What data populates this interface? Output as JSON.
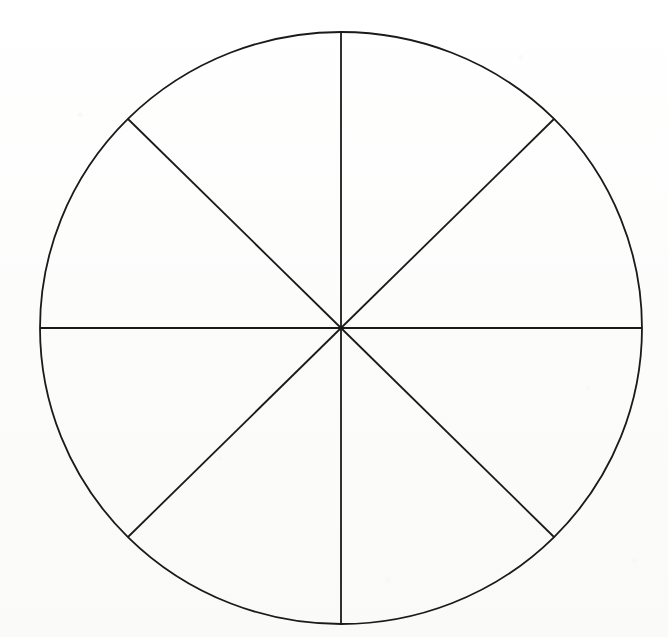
{
  "page": {
    "background_color": "#fdfdfc",
    "width": 668,
    "height": 637,
    "ghost_text_line1": "",
    "ghost_text_line2": "",
    "ghost_text_line3": ""
  },
  "figure": {
    "name": "fraction-circle-eighths",
    "stroke_color": "#1a1a1a",
    "fill_color": "none",
    "stroke_width": 1.8,
    "center_x": 341,
    "center_y": 328,
    "radius_x": 301,
    "radius_y": 296,
    "sector_count": 8,
    "sector_angle_degrees": 45,
    "spokes": [
      {
        "label": "spoke-up",
        "angle_degrees": 270,
        "x2": 341,
        "y2": 32
      },
      {
        "label": "spoke-upper-right",
        "angle_degrees": 315,
        "x2": 554,
        "y2": 119
      },
      {
        "label": "spoke-right",
        "angle_degrees": 0,
        "x2": 642,
        "y2": 328
      },
      {
        "label": "spoke-lower-right",
        "angle_degrees": 45,
        "x2": 554,
        "y2": 537
      },
      {
        "label": "spoke-down",
        "angle_degrees": 90,
        "x2": 341,
        "y2": 624
      },
      {
        "label": "spoke-lower-left",
        "angle_degrees": 135,
        "x2": 128,
        "y2": 537
      },
      {
        "label": "spoke-left",
        "angle_degrees": 180,
        "x2": 40,
        "y2": 328
      },
      {
        "label": "spoke-upper-left",
        "angle_degrees": 225,
        "x2": 128,
        "y2": 119
      }
    ]
  },
  "chart_data": {
    "type": "pie",
    "title": "",
    "xlabel": "",
    "ylabel": "",
    "legend_position": "none",
    "grid": false,
    "labels": [
      "1/8",
      "1/8",
      "1/8",
      "1/8",
      "1/8",
      "1/8",
      "1/8",
      "1/8"
    ],
    "values": [
      12.5,
      12.5,
      12.5,
      12.5,
      12.5,
      12.5,
      12.5,
      12.5
    ],
    "units": "percent",
    "slice_count": 8,
    "slice_angle_degrees": 45,
    "fill_colors": [
      "none",
      "none",
      "none",
      "none",
      "none",
      "none",
      "none",
      "none"
    ],
    "edge_color": "#1a1a1a",
    "annotations": []
  }
}
